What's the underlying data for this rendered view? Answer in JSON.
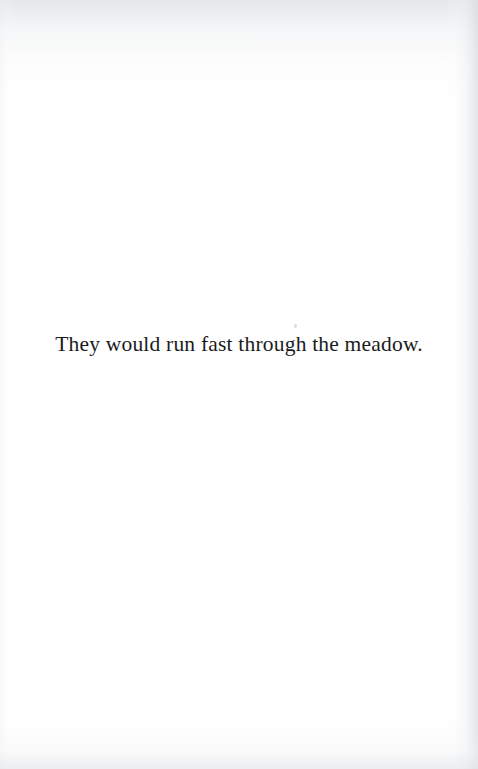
{
  "document": {
    "kind": "scanned-book-page",
    "page_background_color": "#ffffff",
    "ink_color": "#1b1b1d"
  },
  "body": {
    "lines": [
      {
        "text": "They would run fast through the meadow.",
        "alignment": "center"
      }
    ]
  },
  "artifacts": {
    "top_edge_wash": "#dee0e3",
    "right_edge_shadow": "#d8dadd",
    "bottom_edge_wash": "#e1e3e6",
    "left_edge_wash": "#eeeff1",
    "dust_speck": "#aaacb0"
  }
}
